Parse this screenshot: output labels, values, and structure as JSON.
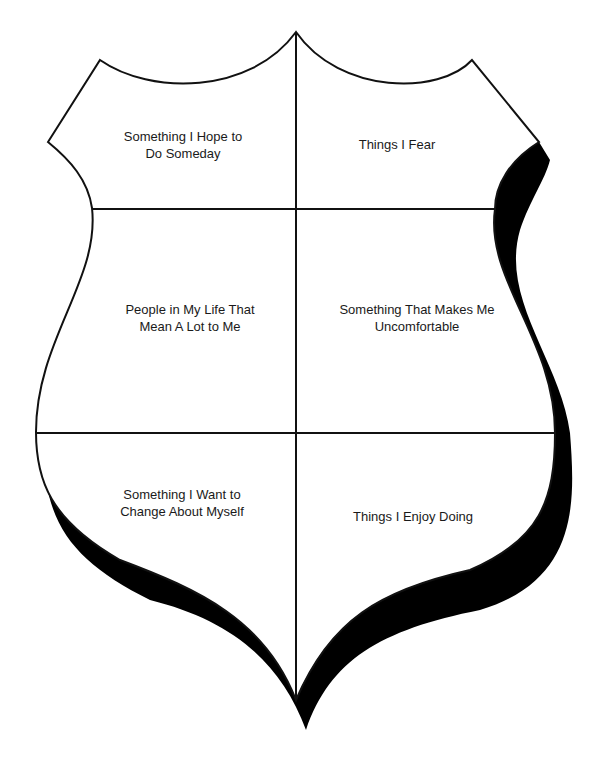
{
  "colors": {
    "outline": "#111111",
    "shadow": "#000000",
    "fill": "#ffffff"
  },
  "sections": [
    {
      "id": "top-left",
      "text": "Something I Hope to\nDo Someday"
    },
    {
      "id": "top-right",
      "text": "Things I Fear"
    },
    {
      "id": "middle-left",
      "text": "People in My Life That\nMean A Lot to Me"
    },
    {
      "id": "middle-right",
      "text": "Something That Makes Me\nUncomfortable"
    },
    {
      "id": "bottom-left",
      "text": "Something I Want to\nChange About Myself"
    },
    {
      "id": "bottom-right",
      "text": "Things I Enjoy Doing"
    }
  ]
}
